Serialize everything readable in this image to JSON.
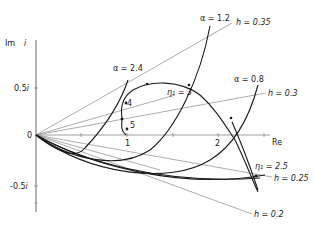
{
  "axes": {
    "x_label": "Re",
    "y_label": "Im",
    "y_label_unit": "i",
    "origin_label": "0",
    "x_ticks": [
      {
        "value": 0.5,
        "label": ""
      },
      {
        "value": 1,
        "label": "1"
      },
      {
        "value": 1.5,
        "label": ""
      },
      {
        "value": 2,
        "label": "2"
      },
      {
        "value": 2.5,
        "label": ""
      }
    ],
    "y_ticks": [
      {
        "value": 0.5,
        "label": "0.5 i"
      },
      {
        "value": -0.5,
        "label": "-0.5 i"
      }
    ]
  },
  "labels": {
    "alpha_24": "α = 2.4",
    "alpha_12": "α = 1.2",
    "alpha_08": "α = 0.8",
    "h_035": "h = 0.35",
    "h_03": "h = 0.3",
    "h_025": "h = 0.25",
    "h_02": "h = 0.2",
    "eta_3": "η₁ = 3",
    "eta_25": "η₁ = 2.5",
    "pt_4": "4",
    "pt_5": "5"
  },
  "colors": {
    "curve": "#1a1a1a",
    "ray": "#8a8a8a",
    "axis": "#555555"
  },
  "caption": ""
}
